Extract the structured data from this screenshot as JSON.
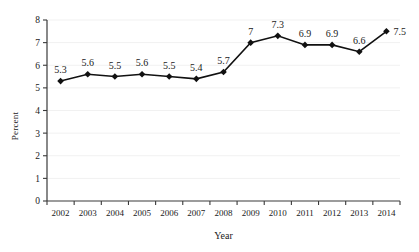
{
  "chart_data": {
    "type": "line",
    "title": "",
    "xlabel": "Year",
    "ylabel": "Percent",
    "categories": [
      "2002",
      "2003",
      "2004",
      "2005",
      "2006",
      "2007",
      "2008",
      "2009",
      "2010",
      "2011",
      "2012",
      "2013",
      "2014"
    ],
    "values": [
      5.3,
      5.6,
      5.5,
      5.6,
      5.5,
      5.4,
      5.7,
      7,
      7.3,
      6.9,
      6.9,
      6.6,
      7.5
    ],
    "point_labels": [
      "5.3",
      "5.6",
      "5.5",
      "5.6",
      "5.5",
      "5.4",
      "5.7",
      "7",
      "7.3",
      "6.9",
      "6.9",
      "6.6",
      "7.5"
    ],
    "label_positions": [
      "above",
      "above",
      "above",
      "above",
      "above",
      "above",
      "above",
      "above",
      "above",
      "above",
      "above",
      "above",
      "right"
    ],
    "ylim": [
      0,
      8
    ],
    "ytick_labels": [
      "0",
      "1",
      "2",
      "3",
      "4",
      "5",
      "6",
      "7",
      "8"
    ],
    "ytick_values": [
      0,
      1,
      2,
      3,
      4,
      5,
      6,
      7,
      8
    ],
    "grid": true,
    "legend": "none",
    "series": [
      {
        "name": "Percent",
        "values": [
          5.3,
          5.6,
          5.5,
          5.6,
          5.5,
          5.4,
          5.7,
          7,
          7.3,
          6.9,
          6.9,
          6.6,
          7.5
        ],
        "marker": "diamond",
        "line_color": "#111111",
        "marker_color": "#111111"
      }
    ]
  },
  "colors": {
    "background": "#ffffff",
    "axis": "#3a3a3a",
    "gridline": "#f1f1f1",
    "line": "#111111",
    "marker": "#111111",
    "text": "#1a1a1a"
  }
}
